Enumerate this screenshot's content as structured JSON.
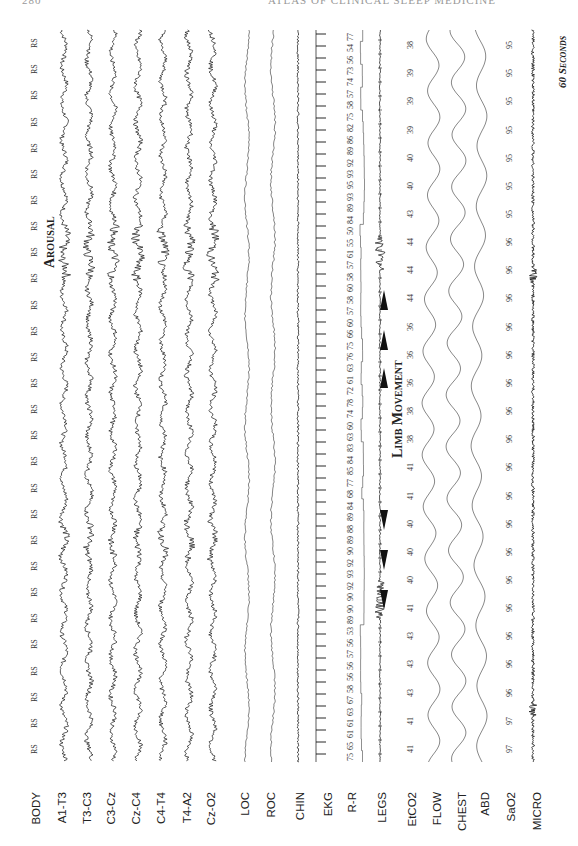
{
  "page": {
    "header_page_number": "280",
    "header_title": "ATLAS OF CLINICAL SLEEP MEDICINE"
  },
  "channels": [
    {
      "label": "BODY",
      "x": 36
    },
    {
      "label": "A1-T3",
      "x": 62
    },
    {
      "label": "T3-C3",
      "x": 87
    },
    {
      "label": "C3-Cz",
      "x": 111
    },
    {
      "label": "Cz-C4",
      "x": 136
    },
    {
      "label": "C4-T4",
      "x": 161
    },
    {
      "label": "T4-A2",
      "x": 187
    },
    {
      "label": "Cz-O2",
      "x": 211
    },
    {
      "label": "LOC",
      "x": 245
    },
    {
      "label": "ROC",
      "x": 271
    },
    {
      "label": "CHIN",
      "x": 300
    },
    {
      "label": "EKG",
      "x": 328
    },
    {
      "label": "R-R",
      "x": 352
    },
    {
      "label": "LEGS",
      "x": 382
    },
    {
      "label": "EtCO2",
      "x": 412
    },
    {
      "label": "FLOW",
      "x": 437
    },
    {
      "label": "CHEST",
      "x": 462
    },
    {
      "label": "ABD",
      "x": 485
    },
    {
      "label": "SaO2",
      "x": 511
    },
    {
      "label": "MICRO",
      "x": 537
    }
  ],
  "body_position": {
    "label": "RS",
    "count": 28
  },
  "etco2_values": [
    "41",
    "41",
    "43",
    "43",
    "43",
    "41",
    "40",
    "40",
    "40",
    "41",
    "41",
    "38",
    "38",
    "36",
    "36",
    "36",
    "44",
    "44",
    "44",
    "43",
    "40",
    "40",
    "39",
    "39",
    "39",
    "38"
  ],
  "sao2_values": [
    "97",
    "97",
    "96",
    "96",
    "96",
    "96",
    "96",
    "96",
    "96",
    "96",
    "96",
    "96",
    "96",
    "96",
    "96",
    "96",
    "96",
    "96",
    "96",
    "95",
    "95",
    "95",
    "95",
    "95",
    "95",
    "95"
  ],
  "rr_values": [
    "77",
    "54",
    "56",
    "73",
    "74",
    "57",
    "58",
    "75",
    "82",
    "86",
    "89",
    "92",
    "93",
    "95",
    "93",
    "89",
    "84",
    "50",
    "55",
    "61",
    "57",
    "58",
    "60",
    "58",
    "57",
    "60",
    "66",
    "75",
    "76",
    "63",
    "61",
    "72",
    "78",
    "74",
    "60",
    "63",
    "83",
    "84",
    "85",
    "77",
    "68",
    "84",
    "89",
    "88",
    "89",
    "90",
    "92",
    "93",
    "92",
    "90",
    "90",
    "89",
    "53",
    "56",
    "57",
    "56",
    "56",
    "58",
    "67",
    "63",
    "61",
    "61",
    "65",
    "75"
  ],
  "annotations": {
    "arousal": "Arousal",
    "limb_movement": "Limb Movement",
    "time_scale": "60 Seconds"
  }
}
